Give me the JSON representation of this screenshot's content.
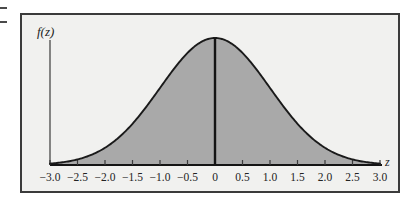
{
  "figure": {
    "caption_y_axis": "f(z)",
    "caption_x_axis": "z",
    "colors": {
      "curve_stroke": "#1a1a1a",
      "area_fill": "#a9a9a9",
      "frame_border": "#3b3b3b",
      "panel_background": "#f1f1ef",
      "axis_line": "#555555",
      "center_line": "#141414"
    }
  },
  "chart_data": {
    "type": "area",
    "title": "",
    "subtitle": "",
    "xlabel": "z",
    "ylabel": "f(z)",
    "distribution": "standard normal",
    "mean": 0,
    "std_dev": 1,
    "grid": false,
    "legend": null,
    "xlim": [
      -3.0,
      3.0
    ],
    "ylim": [
      0,
      0.3989
    ],
    "xticks": [
      -3.0,
      -2.5,
      -2.0,
      -1.5,
      -1.0,
      -0.5,
      0,
      0.5,
      1.0,
      1.5,
      2.0,
      2.5,
      3.0
    ],
    "xtick_labels": [
      "−3.0",
      "−2.5",
      "−2.0",
      "−1.5",
      "−1.0",
      "−0.5",
      "0",
      "0.5",
      "1.0",
      "1.5",
      "2.0",
      "2.5",
      "3.0"
    ],
    "yticks": [],
    "ytick_labels": [],
    "annotations": [
      {
        "name": "center-line",
        "x": 0,
        "description": "vertical line at mean from axis to curve peak"
      }
    ],
    "x": [
      -3.0,
      -2.75,
      -2.5,
      -2.25,
      -2.0,
      -1.75,
      -1.5,
      -1.25,
      -1.0,
      -0.75,
      -0.5,
      -0.25,
      0,
      0.25,
      0.5,
      0.75,
      1.0,
      1.25,
      1.5,
      1.75,
      2.0,
      2.25,
      2.5,
      2.75,
      3.0
    ],
    "values": [
      0.0044,
      0.0091,
      0.0175,
      0.0317,
      0.054,
      0.0863,
      0.1295,
      0.1826,
      0.242,
      0.3011,
      0.3521,
      0.3867,
      0.3989,
      0.3867,
      0.3521,
      0.3011,
      0.242,
      0.1826,
      0.1295,
      0.0863,
      0.054,
      0.0317,
      0.0175,
      0.0091,
      0.0044
    ]
  }
}
